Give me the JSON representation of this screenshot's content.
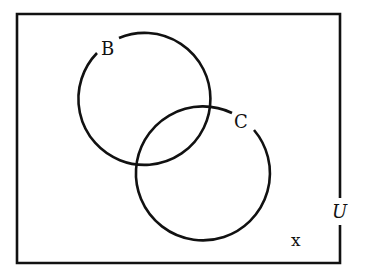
{
  "diagram": {
    "type": "venn",
    "universe": {
      "label": "U",
      "rect": {
        "x": 17,
        "y": 14,
        "width": 323,
        "height": 249
      },
      "stroke": "#111111"
    },
    "sets": [
      {
        "id": "B",
        "label": "B",
        "cx": 140,
        "cy": 104,
        "r": 66
      },
      {
        "id": "C",
        "label": "C",
        "cx": 205,
        "cy": 175,
        "r": 67
      }
    ],
    "elements": [
      {
        "label": "x",
        "region": "outside B and C, inside U"
      }
    ]
  }
}
